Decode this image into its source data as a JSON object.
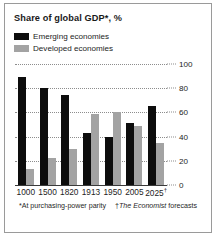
{
  "chart_data": {
    "type": "bar",
    "title": "Share of global GDP*, %",
    "xlabel": "",
    "ylabel": "",
    "ylim": [
      0,
      100
    ],
    "yticks": [
      0,
      20,
      40,
      60,
      80,
      100
    ],
    "grid": true,
    "legend_position": "top-left",
    "categories": [
      "1000",
      "1500",
      "1820",
      "1913",
      "1950",
      "2005",
      "2025"
    ],
    "category_markers": [
      "",
      "",
      "",
      "",
      "",
      "",
      "†"
    ],
    "series": [
      {
        "name": "Emerging economies",
        "color": "#0d0d0d",
        "values": [
          89,
          80,
          74,
          43,
          40,
          51,
          65
        ]
      },
      {
        "name": "Developed economies",
        "color": "#a3a3a3",
        "values": [
          13,
          22,
          30,
          59,
          60,
          49,
          35
        ]
      }
    ],
    "annotations": [
      "*At purchasing-power parity",
      "†The Economist forecasts"
    ]
  },
  "chart": {
    "title": "Share of global GDP*, %"
  },
  "legend": {
    "items": [
      {
        "label": "Emerging economies",
        "color": "#0d0d0d",
        "swatch": "legend-swatch-emerging"
      },
      {
        "label": "Developed economies",
        "color": "#a3a3a3",
        "swatch": "legend-swatch-developed"
      }
    ]
  },
  "yaxis": {
    "ticks": [
      "0",
      "20",
      "40",
      "60",
      "80",
      "100"
    ]
  },
  "xaxis": {
    "labels": [
      "1000",
      "1500",
      "1820",
      "1913",
      "1950",
      "2005",
      "2025"
    ],
    "markers": [
      "",
      "",
      "",
      "",
      "",
      "",
      "†"
    ]
  },
  "footnotes": {
    "source_note": "*At purchasing-power parity",
    "forecast_note_prefix": "†",
    "forecast_note_italic": "The Economist",
    "forecast_note_suffix": " forecasts"
  }
}
